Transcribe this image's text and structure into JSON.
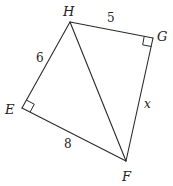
{
  "diagram": {
    "vertices": {
      "H": {
        "label": "H",
        "x": 70,
        "y": 22
      },
      "G": {
        "label": "G",
        "x": 153,
        "y": 38
      },
      "E": {
        "label": "E",
        "x": 22,
        "y": 108
      },
      "F": {
        "label": "F",
        "x": 126,
        "y": 161
      }
    },
    "edges": [
      {
        "from": "H",
        "to": "G",
        "label": "5"
      },
      {
        "from": "H",
        "to": "E",
        "label": "6"
      },
      {
        "from": "E",
        "to": "F",
        "label": "8"
      },
      {
        "from": "G",
        "to": "F",
        "label": "x"
      },
      {
        "from": "H",
        "to": "F",
        "label": ""
      }
    ],
    "right_angles": [
      "E",
      "G"
    ],
    "labels": {
      "H": "H",
      "G": "G",
      "E": "E",
      "F": "F",
      "HG": "5",
      "HE": "6",
      "EF": "8",
      "GF": "x"
    }
  }
}
